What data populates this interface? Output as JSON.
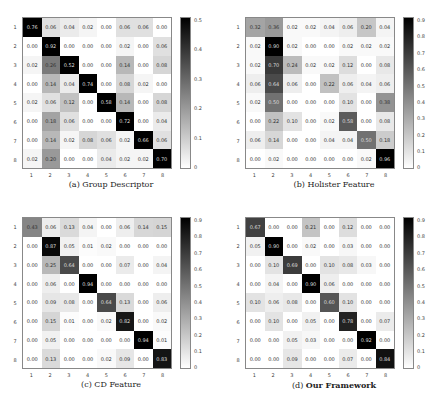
{
  "chart_data": [
    {
      "type": "heatmap",
      "title": "(a) Group Descriptor",
      "caption_prefix": "(a)",
      "caption_name": "Group Descriptor",
      "caption_bold": false,
      "x_ticks": [
        "1",
        "2",
        "3",
        "4",
        "5",
        "6",
        "7",
        "8"
      ],
      "y_ticks": [
        "1",
        "2",
        "3",
        "4",
        "5",
        "6",
        "7",
        "8"
      ],
      "colorbar_ticks": [
        "0",
        "0.1",
        "0.2",
        "0.3",
        "0.4",
        "0.5"
      ],
      "colorbar_max": 0.5,
      "matrix": [
        [
          "0.76",
          "0.06",
          "0.04",
          "0.02",
          "0.00",
          "0.06",
          "0.06",
          "0.00"
        ],
        [
          "0.00",
          "0.92",
          "0.00",
          "0.00",
          "0.00",
          "0.02",
          "0.00",
          "0.06"
        ],
        [
          "0.02",
          "0.26",
          "0.52",
          "0.00",
          "0.00",
          "0.14",
          "0.00",
          "0.08"
        ],
        [
          "0.00",
          "0.14",
          "0.04",
          "0.74",
          "0.00",
          "0.08",
          "0.02",
          "0.00"
        ],
        [
          "0.02",
          "0.06",
          "0.12",
          "0.00",
          "0.58",
          "0.14",
          "0.00",
          "0.08"
        ],
        [
          "0.00",
          "0.18",
          "0.06",
          "0.00",
          "0.00",
          "0.72",
          "0.00",
          "0.04"
        ],
        [
          "0.00",
          "0.14",
          "0.02",
          "0.08",
          "0.06",
          "0.02",
          "0.66",
          "0.06"
        ],
        [
          "0.02",
          "0.20",
          "0.00",
          "0.00",
          "0.04",
          "0.02",
          "0.02",
          "0.70"
        ]
      ]
    },
    {
      "type": "heatmap",
      "title": "(b) Holister Feature",
      "caption_prefix": "(b)",
      "caption_name": "Holister Feature",
      "caption_bold": false,
      "x_ticks": [
        "1",
        "2",
        "3",
        "4",
        "5",
        "6",
        "7",
        "8"
      ],
      "y_ticks": [
        "1",
        "2",
        "3",
        "4",
        "5",
        "6",
        "7",
        "8"
      ],
      "colorbar_ticks": [
        "0",
        "0.1",
        "0.2",
        "0.3",
        "0.4",
        "0.5",
        "0.6",
        "0.7",
        "0.8",
        "0.9"
      ],
      "colorbar_max": 0.9,
      "matrix": [
        [
          "0.32",
          "0.36",
          "0.02",
          "0.02",
          "0.04",
          "0.06",
          "0.20",
          "0.04"
        ],
        [
          "0.02",
          "0.90",
          "0.02",
          "0.00",
          "0.00",
          "0.02",
          "0.02",
          "0.02"
        ],
        [
          "0.02",
          "0.70",
          "0.24",
          "0.02",
          "0.02",
          "0.12",
          "0.00",
          "0.08"
        ],
        [
          "0.06",
          "0.64",
          "0.06",
          "0.00",
          "0.22",
          "0.06",
          "0.04",
          "0.06"
        ],
        [
          "0.02",
          "0.50",
          "0.00",
          "0.00",
          "0.00",
          "0.10",
          "0.00",
          "0.38"
        ],
        [
          "0.00",
          "0.22",
          "0.10",
          "0.00",
          "0.02",
          "0.58",
          "0.00",
          "0.08"
        ],
        [
          "0.06",
          "0.14",
          "0.00",
          "0.00",
          "0.04",
          "0.04",
          "0.50",
          "0.18"
        ],
        [
          "0.00",
          "0.02",
          "0.00",
          "0.00",
          "0.00",
          "0.00",
          "0.02",
          "0.96"
        ]
      ]
    },
    {
      "type": "heatmap",
      "title": "(c) CD Feature",
      "caption_prefix": "(c)",
      "caption_name": "CD Feature",
      "caption_bold": false,
      "x_ticks": [
        "1",
        "2",
        "3",
        "4",
        "5",
        "6",
        "7",
        "8"
      ],
      "y_ticks": [
        "1",
        "2",
        "3",
        "4",
        "5",
        "6",
        "7",
        "8"
      ],
      "colorbar_ticks": [
        "0",
        "0.1",
        "0.2",
        "0.3",
        "0.4",
        "0.5",
        "0.6",
        "0.7",
        "0.8",
        "0.9"
      ],
      "colorbar_max": 0.9,
      "matrix": [
        [
          "0.43",
          "0.06",
          "0.13",
          "0.04",
          "0.00",
          "0.06",
          "0.14",
          "0.15"
        ],
        [
          "0.00",
          "0.87",
          "0.05",
          "0.01",
          "0.02",
          "0.00",
          "0.00",
          "0.00"
        ],
        [
          "0.00",
          "0.25",
          "0.64",
          "0.00",
          "0.00",
          "0.07",
          "0.00",
          "0.04"
        ],
        [
          "0.00",
          "0.06",
          "0.00",
          "0.94",
          "0.00",
          "0.00",
          "0.00",
          "0.00"
        ],
        [
          "0.00",
          "0.09",
          "0.08",
          "0.00",
          "0.64",
          "0.13",
          "0.00",
          "0.06"
        ],
        [
          "0.00",
          "0.15",
          "0.01",
          "0.00",
          "0.02",
          "0.82",
          "0.00",
          "0.02"
        ],
        [
          "0.00",
          "0.05",
          "0.00",
          "0.00",
          "0.00",
          "0.00",
          "0.94",
          "0.01"
        ],
        [
          "0.00",
          "0.13",
          "0.00",
          "0.00",
          "0.02",
          "0.09",
          "0.00",
          "0.83"
        ]
      ]
    },
    {
      "type": "heatmap",
      "title": "(d) Our Framework",
      "caption_prefix": "(d)",
      "caption_name": "Our Framework",
      "caption_bold": true,
      "x_ticks": [
        "1",
        "2",
        "3",
        "4",
        "5",
        "6",
        "7",
        "8"
      ],
      "y_ticks": [
        "1",
        "2",
        "3",
        "4",
        "5",
        "6",
        "7",
        "8"
      ],
      "colorbar_ticks": [
        "0",
        "0.1",
        "0.2",
        "0.3",
        "0.4",
        "0.5",
        "0.6",
        "0.7",
        "0.8",
        "0.9"
      ],
      "colorbar_max": 0.9,
      "matrix": [
        [
          "0.67",
          "0.00",
          "0.00",
          "0.21",
          "0.00",
          "0.12",
          "0.00",
          "0.00"
        ],
        [
          "0.05",
          "0.90",
          "0.00",
          "0.02",
          "0.00",
          "0.03",
          "0.00",
          "0.00"
        ],
        [
          "0.00",
          "0.10",
          "0.69",
          "0.00",
          "0.10",
          "0.08",
          "0.03",
          "0.00"
        ],
        [
          "0.00",
          "0.04",
          "0.00",
          "0.90",
          "0.06",
          "0.00",
          "0.00",
          "0.00"
        ],
        [
          "0.10",
          "0.06",
          "0.08",
          "0.00",
          "0.60",
          "0.10",
          "0.00",
          "0.00"
        ],
        [
          "0.00",
          "0.10",
          "0.00",
          "0.05",
          "0.00",
          "0.78",
          "0.00",
          "0.07"
        ],
        [
          "0.00",
          "0.00",
          "0.05",
          "0.03",
          "0.00",
          "0.00",
          "0.92",
          "0.00"
        ],
        [
          "0.00",
          "0.00",
          "0.09",
          "0.00",
          "0.00",
          "0.07",
          "0.00",
          "0.84"
        ]
      ]
    }
  ]
}
